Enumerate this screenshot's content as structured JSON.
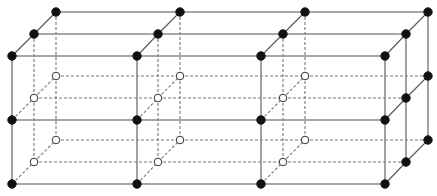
{
  "diagram": {
    "title": "",
    "layers": {
      "front": {
        "xs": [
          12,
          137,
          261,
          385
        ],
        "ys": [
          56,
          120,
          184
        ]
      },
      "middle": {
        "xs": [
          34,
          158,
          283,
          406
        ],
        "ys": [
          34,
          98,
          162
        ]
      },
      "back": {
        "xs": [
          56,
          180,
          305,
          428
        ],
        "ys": [
          12,
          76,
          140
        ]
      }
    },
    "colors": {
      "filled_node": "#111111",
      "open_node_fill": "#ffffff",
      "line": "#8a8a8a",
      "hidden_line": "#777777"
    },
    "node_radius": 4.2
  }
}
